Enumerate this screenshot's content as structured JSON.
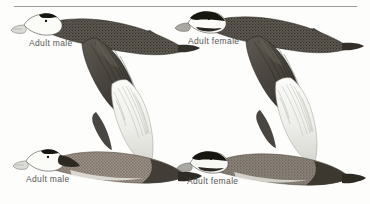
{
  "plate": {
    "background_color": "#fdfdfb",
    "rule": {
      "name": "top-divider-rule",
      "color": "#7a7a7a"
    },
    "ink_color": "#3a3a3a",
    "caption_color": "#4a4a4a",
    "figures": [
      {
        "id": "top-left",
        "caption": "Adult male",
        "plumage": "white head with black crown patch, pale swollen bill, dark brown upperparts, dark upperwing",
        "view": "upperwing in flight, facing right"
      },
      {
        "id": "top-right",
        "caption": "Adult female",
        "plumage": "dark crown with white face stripe and dark cheek bar, dark brown upperparts, dark upperwing",
        "view": "upperwing in flight, facing right"
      },
      {
        "id": "bottom-left",
        "caption": "Adult male",
        "plumage": "white head with black crown patch, pale swollen bill, rufous-brown body, pale whitish underwing",
        "view": "underwing in flight, facing left"
      },
      {
        "id": "bottom-right",
        "caption": "Adult female",
        "plumage": "dark crown with white face stripe and dark cheek bar, mottled brown body, pale whitish underwing",
        "view": "underwing in flight, facing left"
      }
    ]
  }
}
